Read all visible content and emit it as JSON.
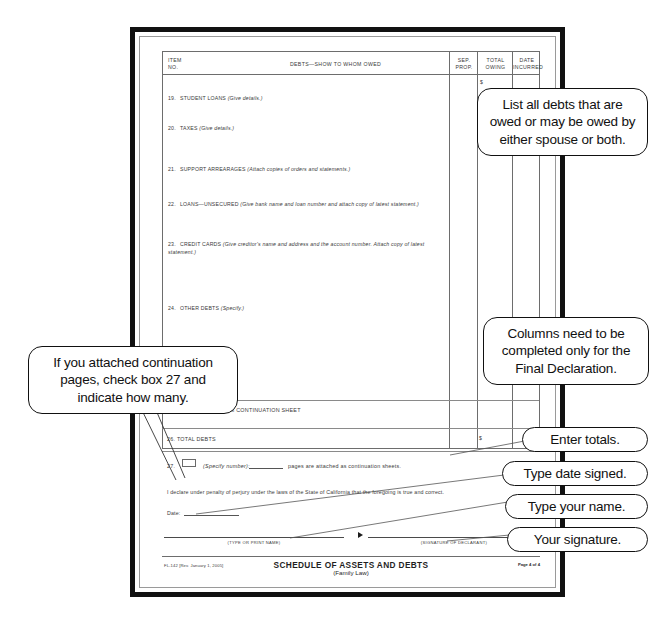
{
  "document": {
    "form_number_rev": "FL-142 [Rev. January 1, 2005]",
    "footer_title": "SCHEDULE OF ASSETS AND DEBTS",
    "footer_subtitle": "(Family Law)",
    "page_label": "Page 4 of 4"
  },
  "table": {
    "headers": {
      "item_no": "ITEM\nNO.",
      "item_no_line1": "ITEM",
      "item_no_line2": "NO.",
      "description": "DEBTS—SHOW TO WHOM OWED",
      "sep_prop_line1": "SEP.",
      "sep_prop_line2": "PROP.",
      "total_owing_line1": "TOTAL",
      "total_owing_line2": "OWING",
      "date_incurred_line1": "DATE",
      "date_incurred_line2": "INCURRED"
    },
    "currency_symbol": "$",
    "rows": [
      {
        "no": "19.",
        "label": "STUDENT LOANS ",
        "hint": "(Give details.)"
      },
      {
        "no": "20.",
        "label": "TAXES ",
        "hint": "(Give details.)"
      },
      {
        "no": "21.",
        "label": "SUPPORT ARREARAGES ",
        "hint": "(Attach copies of orders and statements.)"
      },
      {
        "no": "22.",
        "label": "LOANS—UNSECURED ",
        "hint": "(Give bank name and loan number and attach copy of latest statement.)"
      },
      {
        "no": "23.",
        "label": "CREDIT CARDS ",
        "hint": "(Give creditor's name and address and the account number. Attach copy of latest statement.)"
      },
      {
        "no": "24.",
        "label": "OTHER DEBTS ",
        "hint": "(Specify.)"
      }
    ]
  },
  "totals": {
    "row_25": "25.  TOTAL DEBTS FROM CONTINUATION SHEET",
    "row_26": "26.  TOTAL DEBTS",
    "currency_symbol": "$"
  },
  "continuation": {
    "number": "27.",
    "specify": "(Specify number):",
    "suffix": "pages are attached as continuation sheets."
  },
  "declaration": {
    "text": "I declare under penalty of perjury under the laws of the State of California that the foregoing is true and correct.",
    "date_label": "Date:",
    "print_name_caption": "(TYPE OR PRINT NAME)",
    "signature_caption": "(SIGNATURE OF DECLARANT)"
  },
  "callouts": {
    "list_debts": "List all debts that are owed or may be owed by either spouse or both.",
    "columns_final": "Columns need to be completed only for the Final Declaration.",
    "continuation_pages": "If you attached continuation pages, check box 27 and indicate how many.",
    "enter_totals": "Enter totals.",
    "type_date_signed": "Type date signed.",
    "type_your_name": "Type your name.",
    "your_signature": "Your signature."
  },
  "colors": {
    "page_border": "#111111",
    "table_line": "#6d6d6d",
    "text": "#2c2c2c",
    "callout_border": "#111111",
    "background": "#ffffff"
  }
}
